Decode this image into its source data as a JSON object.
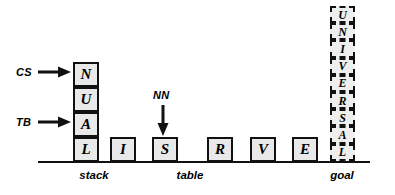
{
  "figure": {
    "width": 395,
    "height": 195,
    "background": "#ffffff",
    "line_color": "#111111",
    "block_fill": "#e9e9e9",
    "goal_fill": "#eeeeee"
  },
  "ground_line": {
    "x": 38,
    "y": 161,
    "width": 332,
    "height": 2
  },
  "stack": {
    "caption": "stack",
    "caption_x": 72,
    "caption_y": 170,
    "caption_width": 44,
    "x": 73,
    "blocks": [
      {
        "label": "N",
        "y": 62
      },
      {
        "label": "U",
        "y": 87
      },
      {
        "label": "A",
        "y": 112
      },
      {
        "label": "L",
        "y": 137
      }
    ]
  },
  "table": {
    "caption": "table",
    "caption_x": 168,
    "caption_y": 170,
    "caption_width": 44,
    "y": 137,
    "blocks": [
      {
        "label": "I",
        "x": 110
      },
      {
        "label": "S",
        "x": 152
      },
      {
        "label": "R",
        "x": 207
      },
      {
        "label": "V",
        "x": 250
      },
      {
        "label": "E",
        "x": 292
      }
    ]
  },
  "goal": {
    "caption": "goal",
    "caption_x": 320,
    "caption_y": 170,
    "caption_width": 44,
    "x": 330,
    "top": 6,
    "blocks": [
      {
        "label": "U",
        "y": 6.0
      },
      {
        "label": "N",
        "y": 23.2
      },
      {
        "label": "I",
        "y": 40.4
      },
      {
        "label": "V",
        "y": 57.6
      },
      {
        "label": "E",
        "y": 74.8
      },
      {
        "label": "R",
        "y": 92.0
      },
      {
        "label": "S",
        "y": 109.2
      },
      {
        "label": "A",
        "y": 126.4
      },
      {
        "label": "L",
        "y": 143.6
      }
    ]
  },
  "pointers": [
    {
      "name": "cs",
      "label": "CS",
      "label_x": 16,
      "label_y": 67,
      "arrow_x": 38,
      "arrow_y": 66,
      "direction": "right",
      "target": "N"
    },
    {
      "name": "tb",
      "label": "TB",
      "label_x": 16,
      "label_y": 117,
      "arrow_x": 38,
      "arrow_y": 116,
      "direction": "right",
      "target": "A"
    },
    {
      "name": "nn",
      "label": "NN",
      "label_x": 153,
      "label_y": 90,
      "arrow_x": 157,
      "arrow_y": 105,
      "direction": "down",
      "target": "S"
    }
  ]
}
